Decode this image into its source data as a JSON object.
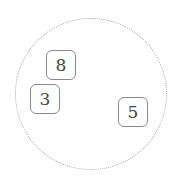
{
  "diagram": {
    "container": {
      "shape": "circle",
      "border_style": "dotted",
      "border_color": "#a8a8a8"
    },
    "nodes": [
      {
        "label": "8",
        "x": 46,
        "y": 50
      },
      {
        "label": "3",
        "x": 30,
        "y": 84
      },
      {
        "label": "5",
        "x": 118,
        "y": 97
      }
    ]
  }
}
